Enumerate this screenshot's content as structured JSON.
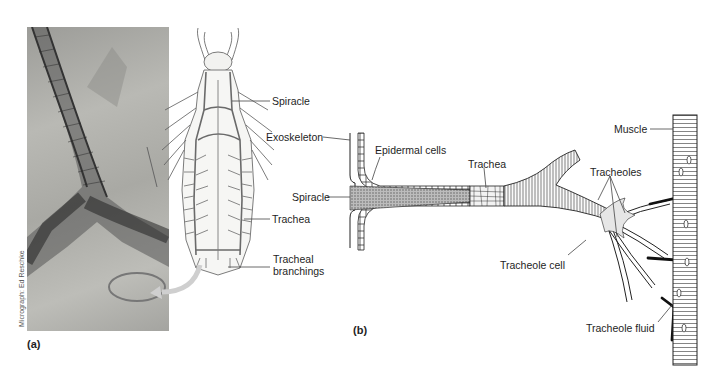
{
  "figure": {
    "panel_a": {
      "label": "(a)",
      "credit": "Micrograph: Ed Reschke",
      "labels": {
        "spiracle": "Spiracle",
        "trachea": "Trachea",
        "tracheal_branchings_line1": "Tracheal",
        "tracheal_branchings_line2": "branchings"
      }
    },
    "panel_b": {
      "label": "(b)",
      "labels": {
        "exoskeleton": "Exoskeleton",
        "epidermal_cells": "Epidermal cells",
        "spiracle": "Spiracle",
        "trachea": "Trachea",
        "tracheoles": "Tracheoles",
        "tracheole_cell": "Tracheole cell",
        "muscle": "Muscle",
        "tracheole_fluid": "Tracheole fluid"
      }
    },
    "colors": {
      "ink": "#1e1e1e",
      "photo_mid": "#b0b0ab",
      "arrow": "#c8c8c8"
    }
  }
}
